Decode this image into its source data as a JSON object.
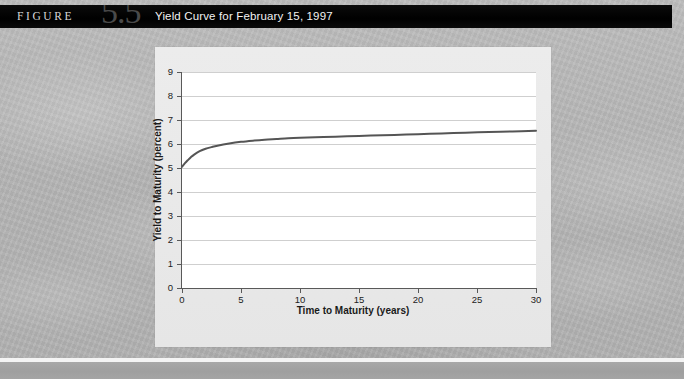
{
  "header": {
    "figure_word": "FIGURE",
    "figure_number": "5.5",
    "title": "Yield Curve for February 15, 1997",
    "bar_color": "#000000",
    "title_color": "#f2f2f2",
    "number_color": "#4a4a4a"
  },
  "panel": {
    "background_color": "#e9e9e9",
    "plot_background_color": "#ffffff",
    "gridline_color": "#cfcfcf",
    "axis_color": "#595959"
  },
  "chart_data": {
    "type": "line",
    "title": "Yield Curve for February 15, 1997",
    "xlabel": "Time to Maturity (years)",
    "ylabel": "Yield to Maturity (percent)",
    "xlim": [
      0,
      30
    ],
    "ylim": [
      0,
      9
    ],
    "xticks": [
      0,
      5,
      10,
      15,
      20,
      25,
      30
    ],
    "yticks": [
      0,
      1,
      2,
      3,
      4,
      5,
      6,
      7,
      8,
      9
    ],
    "xtick_labels": [
      "0",
      "5",
      "10",
      "15",
      "20",
      "25",
      "30"
    ],
    "ytick_labels": [
      "0",
      "1",
      "2",
      "3",
      "4",
      "5",
      "6",
      "7",
      "8",
      "9"
    ],
    "grid": "horizontal",
    "legend": "none",
    "series": [
      {
        "name": "Treasury yield curve",
        "color": "#555555",
        "line_width": 2,
        "x": [
          0,
          0.25,
          0.5,
          0.75,
          1,
          1.5,
          2,
          2.5,
          3,
          4,
          5,
          6,
          7,
          8,
          9,
          10,
          12,
          14,
          16,
          18,
          20,
          22,
          24,
          26,
          28,
          30
        ],
        "y": [
          5.05,
          5.2,
          5.33,
          5.45,
          5.55,
          5.7,
          5.8,
          5.87,
          5.93,
          6.02,
          6.09,
          6.14,
          6.18,
          6.21,
          6.24,
          6.26,
          6.29,
          6.32,
          6.35,
          6.38,
          6.41,
          6.44,
          6.47,
          6.5,
          6.52,
          6.55
        ]
      }
    ]
  },
  "footer": {
    "rule_color": "#a4a4a4"
  }
}
